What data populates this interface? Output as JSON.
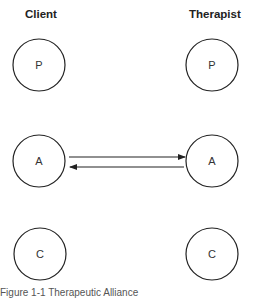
{
  "columns": {
    "client": "Client",
    "therapist": "Therapist"
  },
  "nodes": {
    "client": [
      {
        "label": "P",
        "cx": 39,
        "cy": 65
      },
      {
        "label": "A",
        "cx": 39,
        "cy": 161
      },
      {
        "label": "C",
        "cx": 39,
        "cy": 254
      }
    ],
    "therapist": [
      {
        "label": "P",
        "cx": 212,
        "cy": 65
      },
      {
        "label": "A",
        "cx": 212,
        "cy": 161
      },
      {
        "label": "C",
        "cx": 212,
        "cy": 254
      }
    ]
  },
  "edges": [
    {
      "from": "client.A",
      "to": "therapist.A",
      "direction": "right"
    },
    {
      "from": "therapist.A",
      "to": "client.A",
      "direction": "left"
    }
  ],
  "caption": "Figure 1-1  Therapeutic Alliance"
}
